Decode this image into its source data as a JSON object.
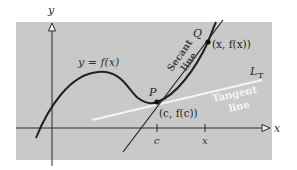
{
  "figure": {
    "panel_color": "#c9c9c9",
    "ink_color": "#2a2a2a",
    "tangent_color": "#f4f4f4",
    "axes": {
      "x_label": "x",
      "y_label": "y"
    },
    "curve": {
      "label": "y = f(x)"
    },
    "points": {
      "P": {
        "name": "P",
        "coords": "(c, f(c))"
      },
      "Q": {
        "name": "Q",
        "coords": "(x, f(x))"
      }
    },
    "ticks": [
      {
        "label": "c"
      },
      {
        "label": "x"
      }
    ],
    "secant": {
      "line1": "Secant",
      "line2": "line"
    },
    "tangent": {
      "line1": "Tangent",
      "line2": "line",
      "symbol_main": "L",
      "symbol_sub": "T"
    }
  }
}
